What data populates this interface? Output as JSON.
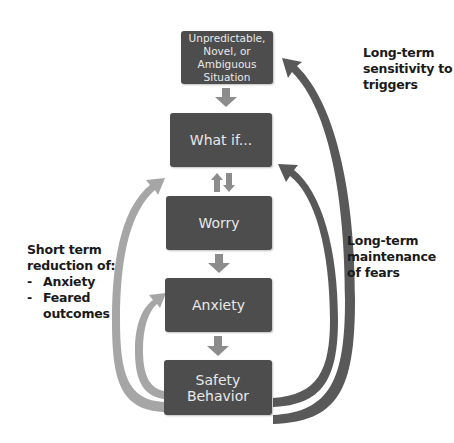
{
  "diagram": {
    "nodes": [
      {
        "id": "situation",
        "label": "Unpredictable, Novel, or Ambiguous Situation",
        "lines": [
          "Unpredictable,",
          "Novel, or Ambiguous",
          "Situation"
        ]
      },
      {
        "id": "what_if",
        "label": "What if..."
      },
      {
        "id": "worry",
        "label": "Worry"
      },
      {
        "id": "anxiety",
        "label": "Anxiety"
      },
      {
        "id": "safety_behavior",
        "label": "Safety Behavior"
      }
    ],
    "edges": [
      {
        "from": "situation",
        "to": "what_if",
        "type": "down-arrow"
      },
      {
        "from": "what_if",
        "to": "worry",
        "type": "bidirectional"
      },
      {
        "from": "worry",
        "to": "anxiety",
        "type": "down-arrow"
      },
      {
        "from": "anxiety",
        "to": "safety_behavior",
        "type": "down-arrow"
      },
      {
        "from": "safety_behavior",
        "to": "what_if",
        "type": "curved-left-light"
      },
      {
        "from": "safety_behavior",
        "to": "anxiety",
        "type": "curved-left-light"
      },
      {
        "from": "safety_behavior",
        "to": "situation",
        "type": "curved-right-dark"
      },
      {
        "from": "safety_behavior",
        "to": "what_if",
        "type": "curved-right-dark"
      }
    ],
    "annotations": {
      "top_right": {
        "lines": [
          "Long-term",
          "sensitivity to",
          "triggers"
        ]
      },
      "right": {
        "lines": [
          "Long-term",
          "maintenance",
          "of fears"
        ]
      },
      "left": {
        "lines": [
          "Short term",
          "reduction of:"
        ],
        "items": [
          "Anxiety",
          "Feared",
          "outcomes"
        ],
        "bullet": "-"
      }
    }
  },
  "colors": {
    "box_fill": "#4d4d4d",
    "box_text": "#e8e8e8",
    "down_arrow": "#8c8c8c",
    "left_arrows": "#a6a6a6",
    "right_arrows": "#595959",
    "label_text": "#1a1a1a"
  }
}
